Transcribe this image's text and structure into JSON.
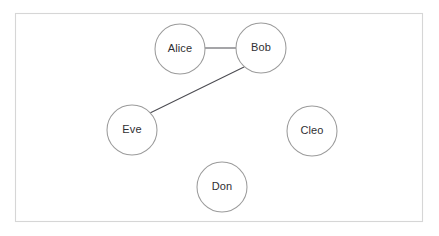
{
  "diagram": {
    "background_color": "#ffffff",
    "frame": {
      "x": 15,
      "y": 13,
      "width": 408,
      "height": 209,
      "stroke_color": "#d6d6d6",
      "stroke_width": 1.1
    },
    "node_style": {
      "radius": 25,
      "fill_color": "#ffffff",
      "stroke_color": "#9b9b9b",
      "stroke_width": 1.05,
      "label_color": "#2f2f33",
      "label_font_size": 11
    },
    "edge_style": {
      "stroke_color": "#4c4c52",
      "stroke_width": 1.05
    },
    "nodes": [
      {
        "id": "alice",
        "label": "Alice",
        "cx": 180,
        "cy": 49,
        "r": 25
      },
      {
        "id": "bob",
        "label": "Bob",
        "cx": 261,
        "cy": 48,
        "r": 25
      },
      {
        "id": "eve",
        "label": "Eve",
        "cx": 132,
        "cy": 130,
        "r": 25
      },
      {
        "id": "cleo",
        "label": "Cleo",
        "cx": 312,
        "cy": 131,
        "r": 25
      },
      {
        "id": "don",
        "label": "Don",
        "cx": 222,
        "cy": 187,
        "r": 25
      }
    ],
    "edges": [
      {
        "id": "alice-bob",
        "source": "alice",
        "target": "bob",
        "x1": 205,
        "y1": 48,
        "x2": 236,
        "y2": 48
      },
      {
        "id": "bob-eve",
        "source": "bob",
        "target": "eve",
        "x1": 244,
        "y1": 67,
        "x2": 150,
        "y2": 113
      }
    ],
    "isolated_nodes": [
      "cleo",
      "don"
    ],
    "node_count": 5,
    "edge_count": 2
  }
}
